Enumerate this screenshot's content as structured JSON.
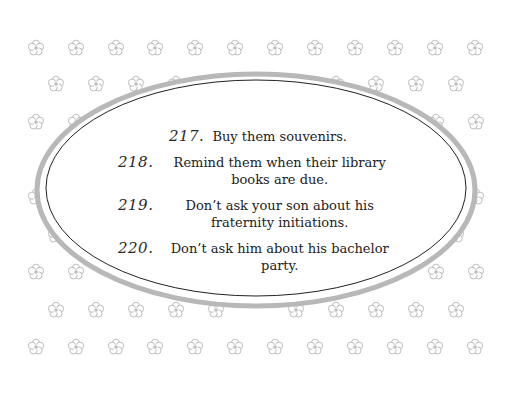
{
  "page": {
    "background": "#ffffff",
    "flower_color": "#bdbdbd",
    "frame_ring_color": "#b8b8b8",
    "frame_line_color": "#222222"
  },
  "pattern": {
    "icon": "flower-icon",
    "rows": [
      {
        "y": 48,
        "xs": [
          36,
          76,
          116,
          155,
          195,
          235,
          275,
          315,
          355,
          395,
          435,
          475
        ]
      },
      {
        "y": 84,
        "xs": [
          56,
          96,
          136,
          176,
          216,
          296,
          336,
          376,
          416,
          456
        ]
      },
      {
        "y": 122,
        "xs": [
          36,
          76,
          436,
          476
        ]
      },
      {
        "y": 160,
        "xs": [
          56,
          456
        ]
      },
      {
        "y": 197,
        "xs": [
          36,
          476
        ]
      },
      {
        "y": 235,
        "xs": [
          56,
          456
        ]
      },
      {
        "y": 272,
        "xs": [
          36,
          76,
          436,
          476
        ]
      },
      {
        "y": 310,
        "xs": [
          56,
          96,
          136,
          176,
          216,
          296,
          336,
          376,
          416,
          456
        ]
      },
      {
        "y": 347,
        "xs": [
          36,
          76,
          116,
          155,
          195,
          235,
          275,
          315,
          355,
          395,
          435,
          475
        ]
      }
    ]
  },
  "items": [
    {
      "number": "217.",
      "text": "Buy them souvenirs."
    },
    {
      "number": "218.",
      "text": "Remind them when their library books are due."
    },
    {
      "number": "219.",
      "text": "Don’t ask your son about his fraternity initiations."
    },
    {
      "number": "220.",
      "text": "Don’t ask him about his bachelor party."
    }
  ]
}
